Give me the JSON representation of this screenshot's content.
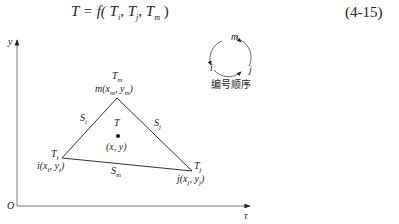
{
  "equation": {
    "text": "T = f(T_i, T_j, T_m)",
    "lhs": "T",
    "rhs": "= f( T",
    "sub_i": "i",
    "sub_j": "j",
    "sub_m": "m",
    "sep": ",",
    "close": ")",
    "number": "(4-15)"
  },
  "axes": {
    "y_label": "y",
    "x_label": "τ",
    "origin_label": "O"
  },
  "nodes": {
    "m": {
      "temp": "T",
      "temp_sub": "m",
      "coord": "m(x",
      "coord_sub1": "m",
      "coord_mid": ", y",
      "coord_sub2": "m",
      "coord_end": ")"
    },
    "i": {
      "temp": "T",
      "temp_sub": "i",
      "coord": "i(x",
      "coord_sub1": "i",
      "coord_mid": ", y",
      "coord_sub2": "i",
      "coord_end": ")"
    },
    "j": {
      "temp": "T",
      "temp_sub": "j",
      "coord": "j(x",
      "coord_sub1": "j",
      "coord_mid": ", y",
      "coord_sub2": "j",
      "coord_end": ")"
    }
  },
  "edges": {
    "si": {
      "label": "S",
      "sub": "i"
    },
    "sj": {
      "label": "S",
      "sub": "j"
    },
    "sm": {
      "label": "S",
      "sub": "m"
    }
  },
  "interior": {
    "temp": "T",
    "coord": "(x, y)"
  },
  "legend": {
    "top": "m",
    "left": "i",
    "right": "j",
    "caption": "编号顺序"
  }
}
